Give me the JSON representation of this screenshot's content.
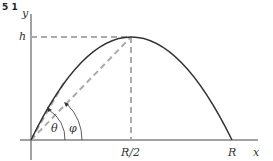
{
  "figure": {
    "number": "5 1",
    "labels": {
      "y_axis": "y",
      "x_axis": "x",
      "height": "h",
      "half_range": "R/2",
      "range": "R",
      "theta": "θ",
      "phi": "φ"
    },
    "colors": {
      "curve": "#333333",
      "axes": "#444444",
      "dashed": "#aaaaaa",
      "text": "#333333"
    }
  }
}
